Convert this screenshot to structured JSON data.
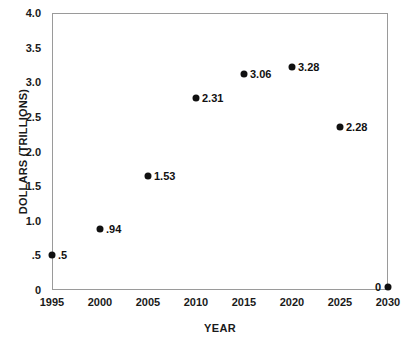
{
  "chart_data": {
    "type": "scatter",
    "title": "",
    "xlabel": "YEAR",
    "ylabel": "DOLLARS (TRILLIONS)",
    "xlim": [
      1995,
      2030
    ],
    "ylim": [
      0,
      4.0
    ],
    "grid": false,
    "legend": null,
    "x_ticks": [
      "1995",
      "2000",
      "2005",
      "2010",
      "2015",
      "2020",
      "2025",
      "2030"
    ],
    "y_ticks": [
      "0",
      ".5",
      "1.0",
      "1.5",
      "2.0",
      "2.5",
      "3.0",
      "3.5",
      "4.0"
    ],
    "x": [
      1995,
      2000,
      2005,
      2010,
      2015,
      2020,
      2025,
      2030
    ],
    "values": [
      0.5,
      0.94,
      1.53,
      2.31,
      3.06,
      3.28,
      2.28,
      0
    ],
    "point_labels": [
      ".5",
      ".94",
      "1.53",
      "2.31",
      "3.06",
      "3.28",
      "2.28",
      "0"
    ],
    "points": [
      {
        "x": 1995,
        "label": ".5",
        "plotted": 0.5,
        "label_side": "right"
      },
      {
        "x": 2000,
        "label": ".94",
        "plotted": 0.88,
        "label_side": "right"
      },
      {
        "x": 2005,
        "label": "1.53",
        "plotted": 1.65,
        "label_side": "right"
      },
      {
        "x": 2010,
        "label": "2.31",
        "plotted": 2.77,
        "label_side": "right"
      },
      {
        "x": 2015,
        "label": "3.06",
        "plotted": 3.12,
        "label_side": "right"
      },
      {
        "x": 2020,
        "label": "3.28",
        "plotted": 3.22,
        "label_side": "right"
      },
      {
        "x": 2025,
        "label": "2.28",
        "plotted": 2.36,
        "label_side": "right"
      },
      {
        "x": 2030,
        "label": "0",
        "plotted": 0.04,
        "label_side": "left"
      }
    ]
  }
}
